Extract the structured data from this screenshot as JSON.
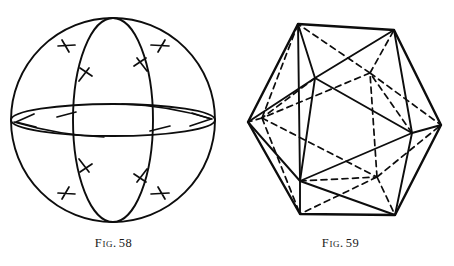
{
  "page": {
    "background_color": "#ffffff",
    "ink_color": "#0d0d0d",
    "width": 454,
    "height": 266,
    "kind": "book-plate-line-drawings"
  },
  "figures": [
    {
      "id": "figure-58",
      "caption_word": "Fig.",
      "caption_number": "58",
      "caption_full": "Fig. 58",
      "subject": "sphere-with-great-circles",
      "description": "Sphere drawn as an outline circle with a vertical great-circle ellipse (meridian) and a strongly foreshortened horizontal great-circle ellipse (equator), with short hatch tick marks indicating direction.",
      "geometry": {
        "outline_circle": {
          "cx": 113,
          "cy": 120,
          "r": 102
        },
        "meridian_ellipse": {
          "cx": 113,
          "cy": 120,
          "rx": 40,
          "ry": 102
        },
        "equator_ellipse": {
          "cx": 113,
          "cy": 120,
          "rx": 102,
          "ry": 16
        },
        "tick_count": 12
      }
    },
    {
      "id": "figure-59",
      "caption_word": "Fig.",
      "caption_number": "59",
      "caption_full": "Fig. 59",
      "subject": "icosahedron",
      "description": "Regular icosahedron in general position; visible edges solid, hidden edges dashed, outer silhouette an irregular hexagon.",
      "geometry": {
        "silhouette_vertices": [
          [
            298,
            24
          ],
          [
            394,
            30
          ],
          [
            441,
            125
          ],
          [
            395,
            215
          ],
          [
            300,
            214
          ],
          [
            248,
            122
          ]
        ],
        "front_triangle_vertices": [
          [
            315,
            78
          ],
          [
            412,
            133
          ],
          [
            300,
            181
          ]
        ],
        "back_triangle_vertices": [
          [
            370,
            73
          ],
          [
            262,
            118
          ],
          [
            377,
            177
          ]
        ],
        "visible_edge_count": 16,
        "hidden_edge_count": 14
      }
    }
  ],
  "captions": {
    "fig58": {
      "word": "Fig.",
      "number": "58"
    },
    "fig59": {
      "word": "Fig.",
      "number": "59"
    }
  }
}
